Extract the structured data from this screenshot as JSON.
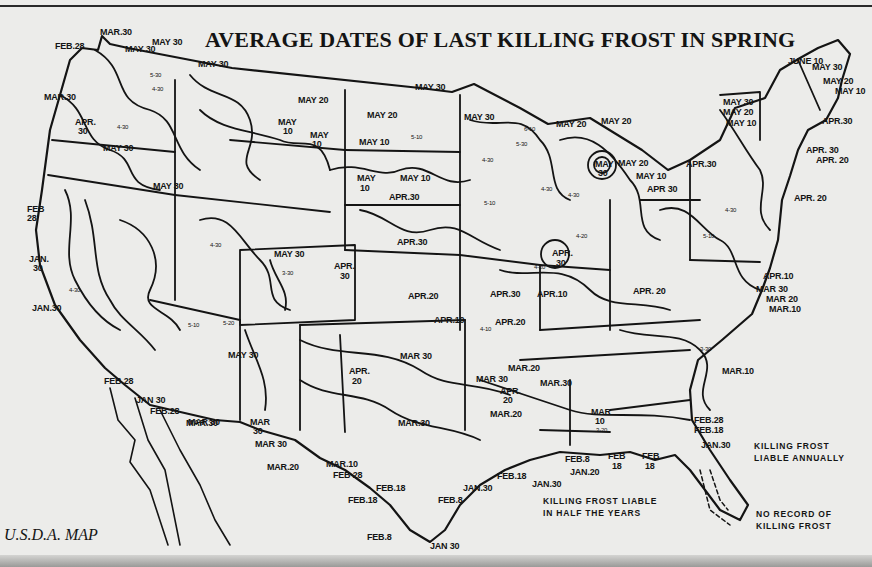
{
  "title": "AVERAGE DATES OF LAST KILLING FROST IN SPRING",
  "credit": "U.S.D.A. MAP",
  "colors": {
    "paper": "#ececea",
    "ink": "#141414"
  },
  "legend": [
    {
      "id": "annual",
      "line1": "KILLING FROST",
      "line2": "LIABLE ANNUALLY",
      "x": 754,
      "y": 440
    },
    {
      "id": "half",
      "line1": "KILLING FROST LIABLE",
      "line2": "IN HALF THE YEARS",
      "x": 543,
      "y": 495
    },
    {
      "id": "none",
      "line1": "NO RECORD OF",
      "line2": "KILLING FROST",
      "x": 756,
      "y": 508
    }
  ],
  "labels": [
    {
      "t": "FEB.28",
      "x": 55,
      "y": 42
    },
    {
      "t": "MAR.30",
      "x": 100,
      "y": 28
    },
    {
      "t": "MAY 30",
      "x": 125,
      "y": 45
    },
    {
      "t": "MAY 30",
      "x": 152,
      "y": 38
    },
    {
      "t": "MAY 30",
      "x": 198,
      "y": 60
    },
    {
      "t": "MAR.30",
      "x": 44,
      "y": 93
    },
    {
      "t": "APR.",
      "x": 75,
      "y": 118
    },
    {
      "t": "30",
      "x": 78,
      "y": 127
    },
    {
      "t": "MAY 30",
      "x": 103,
      "y": 144
    },
    {
      "t": "MAY 30",
      "x": 153,
      "y": 182
    },
    {
      "t": "MAY 20",
      "x": 298,
      "y": 96
    },
    {
      "t": "MAY",
      "x": 278,
      "y": 118
    },
    {
      "t": "10",
      "x": 283,
      "y": 127
    },
    {
      "t": "MAY",
      "x": 310,
      "y": 131
    },
    {
      "t": "10",
      "x": 312,
      "y": 140
    },
    {
      "t": "MAY 30",
      "x": 415,
      "y": 83
    },
    {
      "t": "MAY 20",
      "x": 367,
      "y": 111
    },
    {
      "t": "MAY 10",
      "x": 359,
      "y": 138
    },
    {
      "t": "MAY 30",
      "x": 464,
      "y": 113
    },
    {
      "t": "MAY 20",
      "x": 556,
      "y": 120
    },
    {
      "t": "MAY 20",
      "x": 601,
      "y": 117
    },
    {
      "t": "MAY",
      "x": 595,
      "y": 160
    },
    {
      "t": "30",
      "x": 598,
      "y": 169
    },
    {
      "t": "MAY 20",
      "x": 618,
      "y": 159
    },
    {
      "t": "MAY 10",
      "x": 636,
      "y": 172
    },
    {
      "t": "MAY",
      "x": 357,
      "y": 174
    },
    {
      "t": "10",
      "x": 360,
      "y": 184
    },
    {
      "t": "MAY 10",
      "x": 400,
      "y": 174
    },
    {
      "t": "APR.30",
      "x": 389,
      "y": 193
    },
    {
      "t": "APR.30",
      "x": 397,
      "y": 238
    },
    {
      "t": "MAY 30",
      "x": 274,
      "y": 250
    },
    {
      "t": "APR.",
      "x": 334,
      "y": 262
    },
    {
      "t": "30",
      "x": 340,
      "y": 272
    },
    {
      "t": "APR.20",
      "x": 408,
      "y": 292
    },
    {
      "t": "APR.10",
      "x": 434,
      "y": 316
    },
    {
      "t": "APR.30",
      "x": 490,
      "y": 290
    },
    {
      "t": "APR.10",
      "x": 537,
      "y": 290
    },
    {
      "t": "APR.20",
      "x": 495,
      "y": 318
    },
    {
      "t": "APR.",
      "x": 552,
      "y": 249
    },
    {
      "t": "30",
      "x": 556,
      "y": 259
    },
    {
      "t": "APR 30",
      "x": 647,
      "y": 185
    },
    {
      "t": "APR.30",
      "x": 686,
      "y": 160
    },
    {
      "t": "MAY 30",
      "x": 723,
      "y": 98
    },
    {
      "t": "MAY 20",
      "x": 723,
      "y": 108
    },
    {
      "t": "MAY 10",
      "x": 726,
      "y": 119
    },
    {
      "t": "JUNE 10",
      "x": 788,
      "y": 57
    },
    {
      "t": "MAY 30",
      "x": 812,
      "y": 63
    },
    {
      "t": "MAY 20",
      "x": 823,
      "y": 77
    },
    {
      "t": "MAY 10",
      "x": 835,
      "y": 87
    },
    {
      "t": "APR.30",
      "x": 822,
      "y": 117
    },
    {
      "t": "APR. 30",
      "x": 806,
      "y": 146
    },
    {
      "t": "APR. 20",
      "x": 816,
      "y": 156
    },
    {
      "t": "APR. 20",
      "x": 794,
      "y": 194
    },
    {
      "t": "APR.10",
      "x": 763,
      "y": 272
    },
    {
      "t": "MAR 30",
      "x": 756,
      "y": 285
    },
    {
      "t": "MAR 20",
      "x": 766,
      "y": 295
    },
    {
      "t": "MAR.10",
      "x": 769,
      "y": 305
    },
    {
      "t": "APR. 20",
      "x": 633,
      "y": 287
    },
    {
      "t": "MAR.10",
      "x": 722,
      "y": 367
    },
    {
      "t": "MAR 30",
      "x": 400,
      "y": 352
    },
    {
      "t": "MAR.20",
      "x": 508,
      "y": 364
    },
    {
      "t": "MAR 30",
      "x": 476,
      "y": 375
    },
    {
      "t": "MAR.30",
      "x": 540,
      "y": 379
    },
    {
      "t": "APR.",
      "x": 500,
      "y": 387
    },
    {
      "t": "20",
      "x": 503,
      "y": 396
    },
    {
      "t": "MAR.20",
      "x": 490,
      "y": 410
    },
    {
      "t": "MAR",
      "x": 591,
      "y": 408
    },
    {
      "t": "10",
      "x": 595,
      "y": 417
    },
    {
      "t": "APR.",
      "x": 349,
      "y": 367
    },
    {
      "t": "20",
      "x": 352,
      "y": 377
    },
    {
      "t": "MAY 30",
      "x": 228,
      "y": 351
    },
    {
      "t": "MAR.30",
      "x": 398,
      "y": 419
    },
    {
      "t": "MAR 30",
      "x": 188,
      "y": 418
    },
    {
      "t": "MAR",
      "x": 250,
      "y": 418
    },
    {
      "t": "30",
      "x": 253,
      "y": 427
    },
    {
      "t": "MAR 30",
      "x": 255,
      "y": 440
    },
    {
      "t": "MAR.20",
      "x": 267,
      "y": 463
    },
    {
      "t": "MAR.10",
      "x": 326,
      "y": 460
    },
    {
      "t": "FEB 28",
      "x": 333,
      "y": 471
    },
    {
      "t": "FEB.18",
      "x": 376,
      "y": 484
    },
    {
      "t": "FEB.18",
      "x": 348,
      "y": 496
    },
    {
      "t": "FEB.8",
      "x": 438,
      "y": 496
    },
    {
      "t": "JAN.30",
      "x": 463,
      "y": 484
    },
    {
      "t": "FEB.8",
      "x": 367,
      "y": 533
    },
    {
      "t": "JAN 30",
      "x": 430,
      "y": 542
    },
    {
      "t": "FEB.18",
      "x": 497,
      "y": 472
    },
    {
      "t": "FEB.8",
      "x": 565,
      "y": 455
    },
    {
      "t": "JAN.20",
      "x": 570,
      "y": 468
    },
    {
      "t": "JAN.30",
      "x": 532,
      "y": 480
    },
    {
      "t": "FEB",
      "x": 608,
      "y": 452
    },
    {
      "t": "18",
      "x": 612,
      "y": 462
    },
    {
      "t": "FEB",
      "x": 642,
      "y": 452
    },
    {
      "t": "18",
      "x": 645,
      "y": 462
    },
    {
      "t": "FEB.28",
      "x": 694,
      "y": 416
    },
    {
      "t": "FEB.18",
      "x": 694,
      "y": 426
    },
    {
      "t": "JAN.30",
      "x": 701,
      "y": 441
    },
    {
      "t": "FEB",
      "x": 27,
      "y": 205
    },
    {
      "t": "28",
      "x": 27,
      "y": 214
    },
    {
      "t": "JAN.",
      "x": 29,
      "y": 255
    },
    {
      "t": "30",
      "x": 33,
      "y": 264
    },
    {
      "t": "JAN.30",
      "x": 32,
      "y": 304
    },
    {
      "t": "FEB.28",
      "x": 104,
      "y": 377
    },
    {
      "t": "JAN 30",
      "x": 136,
      "y": 396
    },
    {
      "t": "FEB.28",
      "x": 150,
      "y": 407
    },
    {
      "t": "MAR.30",
      "x": 186,
      "y": 419
    }
  ],
  "small_labels": [
    {
      "t": "5-30",
      "x": 150,
      "y": 72
    },
    {
      "t": "4-30",
      "x": 152,
      "y": 86
    },
    {
      "t": "4-30",
      "x": 117,
      "y": 124
    },
    {
      "t": "4-30",
      "x": 69,
      "y": 287
    },
    {
      "t": "5-10",
      "x": 411,
      "y": 134
    },
    {
      "t": "6-10",
      "x": 524,
      "y": 126
    },
    {
      "t": "5-30",
      "x": 516,
      "y": 141
    },
    {
      "t": "4-30",
      "x": 482,
      "y": 157
    },
    {
      "t": "5-10",
      "x": 484,
      "y": 200
    },
    {
      "t": "4-30",
      "x": 541,
      "y": 186
    },
    {
      "t": "4-30",
      "x": 568,
      "y": 192
    },
    {
      "t": "4-20",
      "x": 576,
      "y": 233
    },
    {
      "t": "4-20",
      "x": 534,
      "y": 264
    },
    {
      "t": "4-10",
      "x": 480,
      "y": 326
    },
    {
      "t": "5-20",
      "x": 223,
      "y": 320
    },
    {
      "t": "5-10",
      "x": 188,
      "y": 322
    },
    {
      "t": "3-30",
      "x": 282,
      "y": 270
    },
    {
      "t": "4-30",
      "x": 210,
      "y": 242
    },
    {
      "t": "3-20",
      "x": 596,
      "y": 427
    },
    {
      "t": "3-30",
      "x": 700,
      "y": 346
    },
    {
      "t": "4-30",
      "x": 725,
      "y": 207
    },
    {
      "t": "5-10",
      "x": 703,
      "y": 233
    }
  ]
}
